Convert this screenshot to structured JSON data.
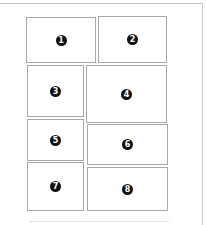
{
  "diagram": {
    "type": "page-layout-panels",
    "frame_color": "#c8c8c8",
    "panel_border_color": "#a8a8a8",
    "badge_color": "#111111",
    "panels": [
      {
        "label": "1",
        "x": 26,
        "y": 17,
        "w": 70,
        "h": 46
      },
      {
        "label": "2",
        "x": 98,
        "y": 16,
        "w": 69,
        "h": 47
      },
      {
        "label": "3",
        "x": 27,
        "y": 65,
        "w": 57,
        "h": 52
      },
      {
        "label": "4",
        "x": 86,
        "y": 65,
        "w": 81,
        "h": 58
      },
      {
        "label": "5",
        "x": 27,
        "y": 119,
        "w": 57,
        "h": 42
      },
      {
        "label": "6",
        "x": 87,
        "y": 124,
        "w": 81,
        "h": 41
      },
      {
        "label": "7",
        "x": 27,
        "y": 162,
        "w": 57,
        "h": 49
      },
      {
        "label": "8",
        "x": 87,
        "y": 167,
        "w": 81,
        "h": 44
      }
    ]
  }
}
